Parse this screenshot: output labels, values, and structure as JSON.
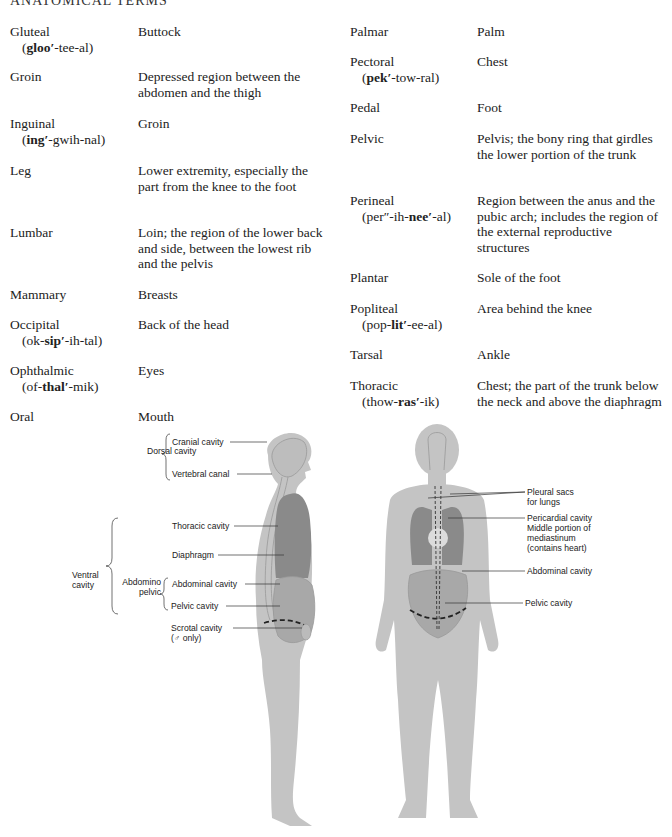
{
  "page_header": "ANATOMICAL TERMS",
  "glossary": {
    "left": [
      {
        "term": "Gluteal",
        "pron_pre": "(",
        "pron_bold": "gloo′",
        "pron_post": "-tee-al)",
        "def": "Buttock"
      },
      {
        "term": "Groin",
        "def": "Depressed region between the abdomen and the thigh"
      },
      {
        "term": "Inguinal",
        "pron_pre": "(",
        "pron_bold": "ing′",
        "pron_post": "-gwih-nal)",
        "def": "Groin"
      },
      {
        "term": "Leg",
        "def": "Lower extremity, especially the part from the knee to the foot"
      },
      {
        "term": "Lumbar",
        "def": "Loin; the region of the lower back and side, between the lowest rib and the pelvis"
      },
      {
        "term": "Mammary",
        "def": "Breasts"
      },
      {
        "term": "Occipital",
        "pron_pre": "(ok-",
        "pron_bold": "sip′",
        "pron_post": "-ih-tal)",
        "def": "Back of the head"
      },
      {
        "term": "Ophthalmic",
        "pron_pre": "(of-",
        "pron_bold": "thal′",
        "pron_post": "-mik)",
        "def": "Eyes"
      },
      {
        "term": "Oral",
        "def": "Mouth"
      }
    ],
    "right": [
      {
        "term": "Palmar",
        "def": "Palm"
      },
      {
        "term": "Pectoral",
        "pron_pre": "(",
        "pron_bold": "pek′",
        "pron_post": "-tow-ral)",
        "def": "Chest"
      },
      {
        "term": "Pedal",
        "def": "Foot"
      },
      {
        "term": "Pelvic",
        "def": "Pelvis; the bony ring that girdles the lower portion of the trunk"
      },
      {
        "term": "Perineal",
        "pron_pre": "(per″-ih-",
        "pron_bold": "nee′",
        "pron_post": "-al)",
        "def": "Region between the anus and the pubic arch; includes the region of the external reproductive structures"
      },
      {
        "term": "Plantar",
        "def": "Sole of the foot"
      },
      {
        "term": "Popliteal",
        "pron_pre": "(pop-",
        "pron_bold": "lit′",
        "pron_post": "-ee-al)",
        "def": "Area behind the knee"
      },
      {
        "term": "Tarsal",
        "def": "Ankle"
      },
      {
        "term": "Thoracic",
        "pron_pre": "(thow-",
        "pron_bold": "ras′",
        "pron_post": "-ik)",
        "def": "Chest; the part of the trunk below the neck and above the diaphragm"
      }
    ]
  },
  "figure": {
    "side_view": {
      "group_dorsal": "Dorsal cavity",
      "group_ventral": "Ventral cavity",
      "group_abdomino": "Abdomino pelvic",
      "labels": {
        "cranial": "Cranial cavity",
        "vertebral": "Vertebral canal",
        "thoracic": "Thoracic cavity",
        "diaphragm": "Diaphragm",
        "abdominal": "Abdominal cavity",
        "pelvic": "Pelvic cavity",
        "scrotal": "Scrotal cavity",
        "scrotal_note": "(♂ only)"
      }
    },
    "front_view": {
      "labels": {
        "pleural_1": "Pleural sacs",
        "pleural_2": "for lungs",
        "pericardial_1": "Pericardial cavity",
        "pericardial_2": "Middle portion of",
        "pericardial_3": "mediastinum",
        "pericardial_4": "(contains heart)",
        "abdominal": "Abdominal cavity",
        "pelvic": "Pelvic cavity"
      }
    },
    "colors": {
      "body": "#c4c4c4",
      "outline": "#9a9a9a",
      "organ_dark": "#8a8a8a",
      "organ_mid": "#a8a8a8",
      "heart": "#dcdcdc"
    }
  }
}
